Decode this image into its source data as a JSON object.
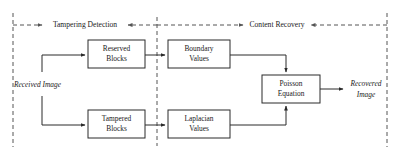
{
  "figure": {
    "type": "flow-diagram",
    "title": "",
    "phases": [
      {
        "id": "tampering-detection",
        "label": "Tampering Detection"
      },
      {
        "id": "content-recovery",
        "label": "Content Recovery"
      }
    ],
    "inputs": [
      {
        "id": "received-image",
        "label": "Received Image"
      }
    ],
    "outputs": [
      {
        "id": "recovered-image",
        "line1": "Recovered",
        "line2": "Image"
      }
    ],
    "blocks": [
      {
        "id": "reserved-blocks",
        "line1": "Reserved",
        "line2": "Blocks",
        "x": 88,
        "y": 40,
        "w": 57,
        "h": 28
      },
      {
        "id": "boundary-values",
        "line1": "Boundary",
        "line2": "Values",
        "x": 168,
        "y": 40,
        "w": 62,
        "h": 28
      },
      {
        "id": "tampered-blocks",
        "line1": "Tampered",
        "line2": "Blocks",
        "x": 88,
        "y": 110,
        "w": 57,
        "h": 28
      },
      {
        "id": "laplacian-values",
        "line1": "Laplacian",
        "line2": "Values",
        "x": 168,
        "y": 110,
        "w": 62,
        "h": 28
      },
      {
        "id": "poisson-equation",
        "line1": "Poisson",
        "line2": "Equation",
        "x": 262,
        "y": 75,
        "w": 58,
        "h": 28
      }
    ],
    "connections": [
      {
        "id": "received-to-reserved",
        "from": "received-image",
        "to": "reserved-blocks"
      },
      {
        "id": "received-to-tampered",
        "from": "received-image",
        "to": "tampered-blocks"
      },
      {
        "id": "reserved-to-boundary",
        "from": "reserved-blocks",
        "to": "boundary-values"
      },
      {
        "id": "tampered-to-laplacian",
        "from": "tampered-blocks",
        "to": "laplacian-values"
      },
      {
        "id": "boundary-to-poisson",
        "from": "boundary-values",
        "to": "poisson-equation"
      },
      {
        "id": "laplacian-to-poisson",
        "from": "laplacian-values",
        "to": "poisson-equation"
      },
      {
        "id": "poisson-to-recovered",
        "from": "poisson-equation",
        "to": "recovered-image"
      }
    ],
    "colors": {
      "stroke": "#2a2a2a",
      "dashed_stroke": "#555555",
      "text": "#1a1a1a",
      "background": "#ffffff"
    }
  }
}
